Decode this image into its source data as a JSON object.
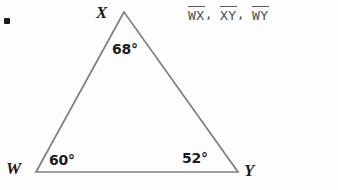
{
  "figure": {
    "type": "triangle",
    "bullet": "•",
    "vertices": [
      {
        "name": "X",
        "label": "X",
        "x": 124,
        "y": 12,
        "angle": "68°",
        "angle_value": 68
      },
      {
        "name": "W",
        "label": "W",
        "x": 36,
        "y": 172,
        "angle": "60°",
        "angle_value": 60
      },
      {
        "name": "Y",
        "label": "Y",
        "x": 238,
        "y": 172,
        "angle": "52°",
        "angle_value": 52
      }
    ],
    "angles": {
      "x": "68°",
      "w": "60°",
      "y": "52°"
    },
    "stroke_color": "#808080",
    "label_color": "#1a1a1a",
    "background_color": "#fdfdfd"
  },
  "segments": {
    "items": [
      {
        "name": "WX",
        "separator": ","
      },
      {
        "name": "XY",
        "separator": ","
      },
      {
        "name": "WY",
        "separator": ""
      }
    ],
    "text_color": "#4a4a4a"
  }
}
